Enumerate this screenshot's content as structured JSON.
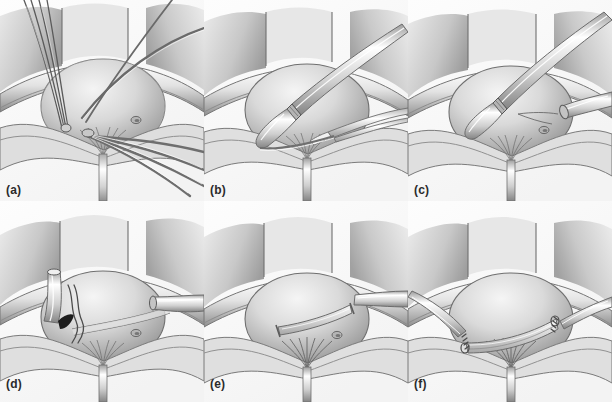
{
  "figure": {
    "style": "grayscale medical line illustration with airbrush shading",
    "layout": {
      "rows": 2,
      "columns": 3,
      "panel_width": 204,
      "panel_height": 201
    },
    "colors": {
      "background": "#ffffff",
      "ink": "#3a3a3a",
      "label_text": "#2b2b2b",
      "tissue_light": "#f2f2f2",
      "tissue_mid": "#c9c9c9",
      "tissue_dark": "#8e8e8e",
      "shadow": "#6d6d6d",
      "instrument_highlight": "#fbfbfb",
      "instrument_shade": "#a8a8a8",
      "suture": "#4a4a4a",
      "marker_black": "#1a1a1a"
    }
  },
  "panels": [
    {
      "id": "panel-a",
      "label": "(a)",
      "row": 1,
      "column": 1,
      "caption": "Anastomotic sutures placed through bladder neck and urethral stump, strands held on tension",
      "elements": [
        "retracted pelvic wound edges",
        "bladder dome",
        "multiple suture strands crossing field",
        "urethral catheter exiting inferiorly",
        "small vesical orifice"
      ]
    },
    {
      "id": "panel-b",
      "label": "(b)",
      "row": 1,
      "column": 2,
      "caption": "Suture passer introduced into the bladder lumen with forceps retracting tissue",
      "elements": [
        "retracted pelvic wound edges",
        "bladder dome",
        "tubular instrument entering from upper right",
        "forceps from right",
        "urethral catheter exiting inferiorly"
      ]
    },
    {
      "id": "panel-c",
      "label": "(c)",
      "row": 1,
      "column": 3,
      "caption": "Second instrument engages the opposite side; needle track visible on bladder wall",
      "elements": [
        "retracted pelvic wound edges",
        "bladder dome",
        "tubular instrument from upper right",
        "second tubular instrument from right",
        "needle tract on bladder surface",
        "small vesical orifice"
      ]
    },
    {
      "id": "panel-d",
      "label": "(d)",
      "row": 2,
      "column": 1,
      "caption": "Instrument on the left with dark tip marker; suture loops drawn through the wall",
      "elements": [
        "retracted pelvic wound edges",
        "bladder dome",
        "angled instrument upper left with dark tip",
        "tubular instrument from right",
        "paired suture loops",
        "urethral catheter exiting inferiorly"
      ]
    },
    {
      "id": "panel-e",
      "label": "(e)",
      "row": 2,
      "column": 2,
      "caption": "Graft or sling positioned transversely across the bladder base",
      "elements": [
        "retracted pelvic wound edges",
        "bladder dome",
        "transverse band across bladder base",
        "tubular instrument from right",
        "small vesical orifice",
        "urethral catheter exiting inferiorly"
      ]
    },
    {
      "id": "panel-f",
      "label": "(f)",
      "row": 2,
      "column": 3,
      "caption": "Completed repair: band secured at both ends with interrupted sutures",
      "elements": [
        "retracted pelvic wound edges",
        "bladder dome",
        "transverse band secured both sides",
        "interrupted sutures at left and right anchors",
        "urethral catheter exiting inferiorly"
      ]
    }
  ]
}
